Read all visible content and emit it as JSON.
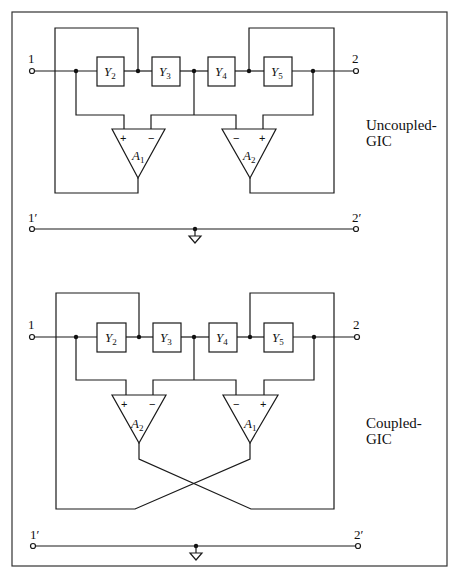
{
  "figure": {
    "border_color": "#333333",
    "uncoupled": {
      "caption_line1": "Uncoupled-",
      "caption_line2": "GIC",
      "terminal_in": "1",
      "terminal_out": "2",
      "terminal_in_ground": "1′",
      "terminal_out_ground": "2′",
      "admittances": [
        {
          "sym": "Y",
          "sub": "2"
        },
        {
          "sym": "Y",
          "sub": "3"
        },
        {
          "sym": "Y",
          "sub": "4"
        },
        {
          "sym": "Y",
          "sub": "5"
        }
      ],
      "amp_left": {
        "sym": "A",
        "sub": "1",
        "in_left": "+",
        "in_right": "−"
      },
      "amp_right": {
        "sym": "A",
        "sub": "2",
        "in_left": "−",
        "in_right": "+"
      }
    },
    "coupled": {
      "caption_line1": "Coupled-",
      "caption_line2": "GIC",
      "terminal_in": "1",
      "terminal_out": "2",
      "terminal_in_ground": "1′",
      "terminal_out_ground": "2′",
      "admittances": [
        {
          "sym": "Y",
          "sub": "2"
        },
        {
          "sym": "Y",
          "sub": "3"
        },
        {
          "sym": "Y",
          "sub": "4"
        },
        {
          "sym": "Y",
          "sub": "5"
        }
      ],
      "amp_left": {
        "sym": "A",
        "sub": "2",
        "in_left": "+",
        "in_right": "−"
      },
      "amp_right": {
        "sym": "A",
        "sub": "1",
        "in_left": "−",
        "in_right": "+"
      }
    }
  }
}
